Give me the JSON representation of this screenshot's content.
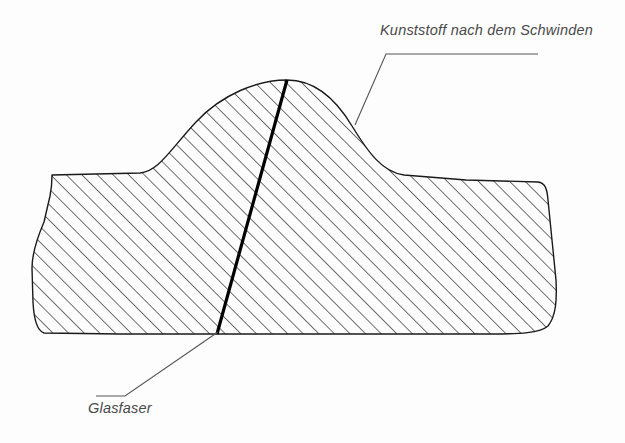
{
  "figure": {
    "title_label": "Kunststoff nach dem Schwinden",
    "fiber_label": "Glasfaser",
    "colors": {
      "background": "#fdfdfd",
      "outline": "#1a1a1a",
      "hatch": "#2b2b2b",
      "fiber": "#000000",
      "leader": "#555555",
      "text": "#4a4a4a"
    },
    "geometry": {
      "outline_path": "M 52,175 L 140,173 C 158,172 170,150 196,122 C 222,94 258,80 287,80 C 312,80 334,96 352,126 C 368,152 382,172 404,175 L 466,180 L 538,182 C 545,183 547,188 548,200 L 556,280 C 557,300 556,316 548,326 C 540,333 520,334 492,334 L 120,334 L 44,333 C 38,331 34,322 33,302 L 32,268 C 32,252 38,236 44,222 L 50,196 C 52,186 52,180 52,175 Z",
      "fiber_line": {
        "x1": 287,
        "y1": 80,
        "x2": 217,
        "y2": 334,
        "width": 3.2
      },
      "leader_top": "M 355,125 L 386,54 L 538,54",
      "leader_bottom": "M 218,332 L 125,396 L 96,396",
      "hatch_angle_deg": 45,
      "hatch_spacing_px": 7.8
    }
  }
}
